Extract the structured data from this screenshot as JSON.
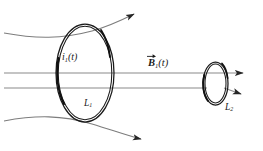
{
  "figure": {
    "background_color": "#ffffff",
    "width": 263,
    "height": 151
  },
  "colors": {
    "wire_stroke": "#1a1a1a",
    "field_line_stroke": "#8a8a8a",
    "curved_field_stroke": "#7d7d7d",
    "arrow_fill": "#1a1a1a",
    "label_text": "#1a1a1a"
  },
  "labels": {
    "current": {
      "symbol": "i",
      "subscript": "1",
      "argument": "(t)",
      "text": "i",
      "paren": "(t)"
    },
    "bfield": {
      "symbol": "B",
      "subscript": "1",
      "argument": "(t)",
      "text": "B",
      "paren": "(t)"
    },
    "loop_large": {
      "symbol": "L",
      "subscript": "1",
      "text": "L"
    },
    "loop_small": {
      "symbol": "L",
      "subscript": "2",
      "text": "L"
    }
  },
  "elements": {
    "large_loop": {
      "name": "current-carrying-loop-L1",
      "center_x": 85,
      "center_y": 73,
      "radius_x": 29,
      "radius_y": 49,
      "wire_gap": 2.2
    },
    "small_loop": {
      "name": "pickup-loop-L2",
      "center_x": 215.5,
      "center_y": 83.5,
      "radius_x": 12.5,
      "radius_y": 21.5,
      "wire_gap": 2.0
    },
    "field_lines_straight": [
      {
        "name": "field-line-upper",
        "y": 73,
        "x_start": 4,
        "x_end": 249
      },
      {
        "name": "field-line-lower",
        "y": 88,
        "x_start": 4,
        "x_end": 240
      }
    ],
    "field_lines_curved": [
      {
        "name": "field-line-curved-top",
        "direction": "up-right"
      },
      {
        "name": "field-line-curved-bottom",
        "direction": "down-right"
      }
    ],
    "arrowheads": [
      {
        "name": "arrowhead-top-curve",
        "x": 140,
        "y": 12
      },
      {
        "name": "arrowhead-bottom-curve",
        "x": 147,
        "y": 140
      },
      {
        "name": "arrowhead-field-upper",
        "x": 249,
        "y": 73
      },
      {
        "name": "arrowhead-field-lower-angled",
        "x": 247,
        "y": 94
      }
    ]
  }
}
